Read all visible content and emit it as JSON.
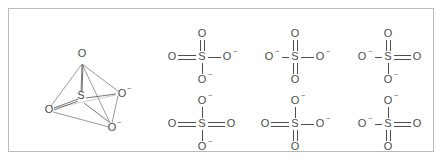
{
  "figure": {
    "border_color": "#b9b9b9",
    "background": "#ffffff",
    "line_color": "#4d4d4d"
  },
  "model_3d": {
    "name": "sulfate-tetrahedral-model",
    "center_atom": "S",
    "vertices": [
      {
        "id": "o-top",
        "label": "O",
        "charge": "",
        "x": 59,
        "y": 22
      },
      {
        "id": "o-left",
        "label": "O",
        "charge": "",
        "x": 26,
        "y": 74
      },
      {
        "id": "o-right",
        "label": "O",
        "charge": "−",
        "x": 99,
        "y": 58
      },
      {
        "id": "o-bottom",
        "label": "O",
        "charge": "−",
        "x": 89,
        "y": 92
      }
    ],
    "center": {
      "label": "S",
      "x": 58,
      "y": 62
    }
  },
  "lewis_structures": [
    {
      "id": "resonance-1",
      "index": 1,
      "center": "S",
      "top": {
        "label": "O",
        "charge": "",
        "bond": "double"
      },
      "left": {
        "label": "O",
        "charge": "",
        "bond": "double"
      },
      "right": {
        "label": "O",
        "charge": "−",
        "bond": "single"
      },
      "bottom": {
        "label": "O",
        "charge": "−",
        "bond": "single"
      }
    },
    {
      "id": "resonance-2",
      "index": 2,
      "center": "S",
      "top": {
        "label": "O",
        "charge": "",
        "bond": "double"
      },
      "left": {
        "label": "O",
        "charge": "−",
        "bond": "single"
      },
      "right": {
        "label": "O",
        "charge": "−",
        "bond": "single"
      },
      "bottom": {
        "label": "O",
        "charge": "",
        "bond": "double"
      }
    },
    {
      "id": "resonance-3",
      "index": 3,
      "center": "S",
      "top": {
        "label": "O",
        "charge": "",
        "bond": "double"
      },
      "left": {
        "label": "O",
        "charge": "−",
        "bond": "single"
      },
      "right": {
        "label": "O",
        "charge": "",
        "bond": "double"
      },
      "bottom": {
        "label": "O",
        "charge": "−",
        "bond": "single"
      }
    },
    {
      "id": "resonance-4",
      "index": 4,
      "center": "S",
      "top": {
        "label": "O",
        "charge": "−",
        "bond": "single"
      },
      "left": {
        "label": "O",
        "charge": "",
        "bond": "double"
      },
      "right": {
        "label": "O",
        "charge": "",
        "bond": "double"
      },
      "bottom": {
        "label": "O",
        "charge": "−",
        "bond": "single"
      }
    },
    {
      "id": "resonance-5",
      "index": 5,
      "center": "S",
      "top": {
        "label": "O",
        "charge": "−",
        "bond": "single"
      },
      "left": {
        "label": "O",
        "charge": "",
        "bond": "double"
      },
      "right": {
        "label": "O",
        "charge": "−",
        "bond": "single"
      },
      "bottom": {
        "label": "O",
        "charge": "",
        "bond": "double"
      }
    },
    {
      "id": "resonance-6",
      "index": 6,
      "center": "S",
      "top": {
        "label": "O",
        "charge": "−",
        "bond": "single"
      },
      "left": {
        "label": "O",
        "charge": "−",
        "bond": "single"
      },
      "right": {
        "label": "O",
        "charge": "",
        "bond": "double"
      },
      "bottom": {
        "label": "O",
        "charge": "",
        "bond": "double"
      }
    }
  ]
}
